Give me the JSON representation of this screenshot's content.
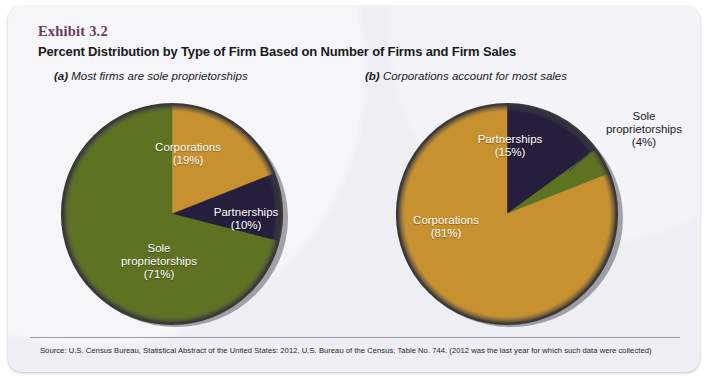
{
  "exhibit": {
    "label": "Exhibit 3.2",
    "title": "Percent Distribution by Type of Firm Based on Number of Firms and Firm Sales"
  },
  "panels": [
    {
      "tag": "(a)",
      "caption": "Most firms are sole proprietorships"
    },
    {
      "tag": "(b)",
      "caption": "Corporations account for most sales"
    }
  ],
  "labels": {
    "a_corporations": "Corporations\n(19%)",
    "a_corporations_name": "Corporations",
    "a_corporations_value": "(19%)",
    "a_partnerships_name": "Partnerships",
    "a_partnerships_value": "(10%)",
    "a_sole_name": "Sole\nproprietorships",
    "a_sole_line1": "Sole",
    "a_sole_line2": "proprietorships",
    "a_sole_value": "(71%)",
    "b_partnerships_name": "Partnerships",
    "b_partnerships_value": "(15%)",
    "b_corporations_name": "Corporations",
    "b_corporations_value": "(81%)",
    "b_sole_line1": "Sole",
    "b_sole_line2": "proprietorships",
    "b_sole_value": "(4%)"
  },
  "source": "Source: U.S. Census Bureau, Statistical Abstract of the United States: 2012, U.S. Bureau of the Census, Table No. 744. (2012 was the last year for which such data were collected)",
  "colors": {
    "corporations": "#c8912f",
    "partnerships": "#251e3c",
    "sole_proprietorships": "#5d7322",
    "card_background": "#eeeef4",
    "exhibit_label": "#6b3a63",
    "text": "#1a1a1a"
  },
  "chart_data": [
    {
      "type": "pie",
      "title": "(a) Most firms are sole proprietorships",
      "subtitle": "Percent distribution by type of firm based on number of firms",
      "unit": "percent",
      "start_angle_deg": 0,
      "direction": "clockwise",
      "legend": "inside-slice-labels",
      "categories": [
        "Corporations",
        "Partnerships",
        "Sole proprietorships"
      ],
      "values": [
        19,
        10,
        71
      ],
      "slice_colors": [
        "#c8912f",
        "#251e3c",
        "#5d7322"
      ],
      "labels": [
        "Corporations (19%)",
        "Partnerships (10%)",
        "Sole proprietorships (71%)"
      ]
    },
    {
      "type": "pie",
      "title": "(b) Corporations account for most sales",
      "subtitle": "Percent distribution by type of firm based on firm sales",
      "unit": "percent",
      "start_angle_deg": 0,
      "direction": "clockwise",
      "legend": "inside-slice-labels",
      "categories": [
        "Partnerships",
        "Sole proprietorships",
        "Corporations"
      ],
      "values": [
        15,
        4,
        81
      ],
      "slice_colors": [
        "#251e3c",
        "#5d7322",
        "#c8912f"
      ],
      "labels": [
        "Partnerships (15%)",
        "Sole proprietorships (4%)",
        "Corporations (81%)"
      ]
    }
  ]
}
